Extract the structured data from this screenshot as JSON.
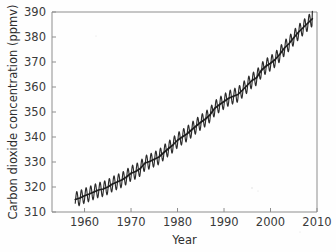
{
  "figure": {
    "background_color": "#fefefe",
    "axis_color": "#8e8e8e",
    "data_color": "#2b2b2b",
    "text_color": "#3a3a3a"
  },
  "chart_data": {
    "type": "line",
    "title": "",
    "xlabel": "Year",
    "ylabel": "Carbon dioxide concentration (ppmv)",
    "xlim": [
      1953,
      2010
    ],
    "ylim": [
      310,
      390
    ],
    "xticks": [
      1960,
      1970,
      1980,
      1990,
      2000,
      2010
    ],
    "xtick_labels": [
      "1960",
      "1970",
      "1980",
      "1990",
      "2000",
      "2010"
    ],
    "yticks": [
      310,
      320,
      330,
      340,
      350,
      360,
      370,
      380,
      390
    ],
    "ytick_labels": [
      "310",
      "320",
      "330",
      "340",
      "350",
      "360",
      "370",
      "380",
      "390"
    ],
    "grid": false,
    "legend": false,
    "tick_direction": "in",
    "series": [
      {
        "name": "Monthly mean CO2 (Mauna Loa)",
        "color": "#2b2b2b",
        "seasonal_amplitude_ppmv": 6.0,
        "x": [
          1958,
          1959,
          1960,
          1961,
          1962,
          1963,
          1964,
          1965,
          1966,
          1967,
          1968,
          1969,
          1970,
          1971,
          1972,
          1973,
          1974,
          1975,
          1976,
          1977,
          1978,
          1979,
          1980,
          1981,
          1982,
          1983,
          1984,
          1985,
          1986,
          1987,
          1988,
          1989,
          1990,
          1991,
          1992,
          1993,
          1994,
          1995,
          1996,
          1997,
          1998,
          1999,
          2000,
          2001,
          2002,
          2003,
          2004,
          2005,
          2006,
          2007,
          2008,
          2009
        ],
        "values": [
          315.0,
          315.6,
          316.5,
          317.2,
          318.0,
          318.8,
          319.2,
          320.0,
          321.2,
          322.0,
          322.8,
          324.0,
          325.5,
          326.2,
          327.4,
          329.6,
          330.2,
          331.1,
          332.0,
          333.7,
          335.3,
          336.8,
          338.7,
          340.0,
          341.2,
          342.8,
          344.4,
          345.9,
          347.2,
          348.9,
          351.5,
          352.9,
          354.2,
          355.5,
          356.3,
          357.0,
          358.8,
          360.7,
          362.6,
          363.7,
          366.6,
          368.3,
          369.5,
          371.0,
          373.1,
          375.6,
          377.4,
          379.7,
          381.9,
          383.7,
          385.5,
          387.3
        ]
      }
    ]
  }
}
